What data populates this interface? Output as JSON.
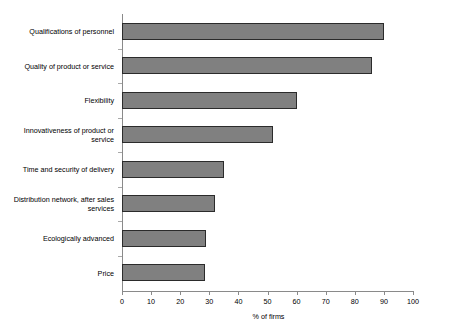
{
  "chart_data": {
    "type": "bar",
    "orientation": "horizontal",
    "title": "",
    "xlabel": "% of firms",
    "ylabel": "",
    "xlim": [
      0,
      100
    ],
    "xticks": [
      0,
      10,
      20,
      30,
      40,
      50,
      60,
      70,
      80,
      90,
      100
    ],
    "grid": false,
    "legend": false,
    "categories": [
      "Qualifications of personnel",
      "Quality of product or service",
      "Flexibility",
      "Innovativeness of product or service",
      "Time and security of delivery",
      "Distribution network, after sales services",
      "Ecologically advanced",
      "Price"
    ],
    "values": [
      90,
      86,
      60,
      52,
      35,
      32,
      29,
      28.5
    ],
    "series": [
      {
        "name": "% of firms",
        "values": [
          90,
          86,
          60,
          52,
          35,
          32,
          29,
          28.5
        ]
      }
    ],
    "bar_fill_color": "#808080",
    "bar_border_color": "#2b2b2b",
    "axis_color": "#8a8a8a",
    "background_color": "#ffffff"
  }
}
